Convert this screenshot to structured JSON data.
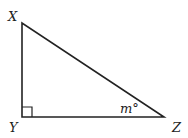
{
  "diagram": {
    "type": "right-triangle",
    "vertices": {
      "X": {
        "label": "X",
        "x": 22,
        "y": 23
      },
      "Y": {
        "label": "Y",
        "x": 22,
        "y": 117
      },
      "Z": {
        "label": "Z",
        "x": 164,
        "y": 117
      }
    },
    "right_angle_at": "Y",
    "angle_label": {
      "vertex": "Z",
      "text": "m°"
    },
    "colors": {
      "stroke": "#222222",
      "background": "#ffffff"
    }
  }
}
